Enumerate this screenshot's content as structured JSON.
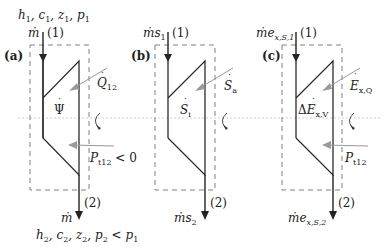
{
  "panels": [
    {
      "id": "a",
      "tag": "(a)",
      "inlet_state": "h₁, c₁, z₁, p₁",
      "inlet_flow": "ṁ",
      "inlet_point": "(1)",
      "outlet_point": "(2)",
      "outlet_flow": "ṁ",
      "outlet_state": "h₂, c₂, z₂, p₂ < p₁",
      "inside_label": "Ψ̇",
      "side_input": "Q̇₁₂",
      "work_label": "P_t12 < 0"
    },
    {
      "id": "b",
      "tag": "(b)",
      "inlet_flow": "ṁs₁",
      "inlet_point": "(1)",
      "outlet_point": "(2)",
      "outlet_flow": "ṁs₂",
      "inside_label": "Ṡᵢ",
      "side_input": "Ṡₐ"
    },
    {
      "id": "c",
      "tag": "(c)",
      "inlet_flow": "ṁe_x,S,1",
      "inlet_point": "(1)",
      "outlet_point": "(2)",
      "outlet_flow": "ṁe_x,S,2",
      "inside_label": "ΔĖ_x,V",
      "side_input": "Ė_x,Q",
      "work_label": "P_t12"
    }
  ],
  "labels": {
    "a_tag": "(a)",
    "b_tag": "(b)",
    "c_tag": "(c)",
    "p1": "(1)",
    "p2": "(2)",
    "a_in_state_h": "h",
    "a_in_state_rest": "1, c1, z1, p1",
    "a_mdot": "ṁ",
    "a_psi": "Ψ",
    "a_Q": "Q",
    "a_Q_sub": "12",
    "a_P": "P",
    "a_P_sub": "t12",
    "a_P_rel": " < 0",
    "a_out_mdot": "ṁ",
    "b_in_m": "ṁs",
    "b_in_sub": "1",
    "b_Si": "S",
    "b_Si_sub": "i",
    "b_Sa": "S",
    "b_Sa_sub": "a",
    "b_out_m": "ṁs",
    "b_out_sub": "2",
    "c_in_m": "ṁe",
    "c_in_sub": "x,S,1",
    "c_delta": "Δ",
    "c_E": "E",
    "c_EV_sub": "x,V",
    "c_EQ": "E",
    "c_EQ_sub": "x,Q",
    "c_P": "P",
    "c_P_sub": "t12",
    "c_out_m": "ṁe",
    "c_out_sub": "x,S,2"
  },
  "colors": {
    "line": "#2b2b2b",
    "dashed": "#7a7a7a",
    "dotted": "#b0b0b0",
    "gray_arrow": "#8f8f8f"
  }
}
